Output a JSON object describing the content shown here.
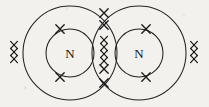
{
  "figure": {
    "background_color": "#f2f1ee",
    "ink_color": "#1a1a1a",
    "width": 209,
    "height": 107
  },
  "atoms": [
    {
      "id": "left-atom",
      "label": "N",
      "nucleus_cx": 70,
      "nucleus_cy": 53,
      "nucleus_r": 24,
      "shell_cx": 70,
      "shell_cy": 53,
      "shell_r": 47
    },
    {
      "id": "right-atom",
      "label": "N",
      "nucleus_cx": 139,
      "nucleus_cy": 53,
      "nucleus_r": 24,
      "shell_cx": 139,
      "shell_cy": 53,
      "shell_r": 47
    }
  ],
  "electrons": {
    "symbol": "x",
    "groups": [
      {
        "id": "left-atom-top-electron",
        "name": "left-top",
        "count": 1,
        "positions": [
          [
            60,
            29
          ]
        ]
      },
      {
        "id": "left-atom-bottom-electron",
        "name": "left-bottom",
        "count": 1,
        "positions": [
          [
            60,
            77
          ]
        ]
      },
      {
        "id": "left-atom-outer-edge-electrons",
        "name": "left-edge",
        "count": 3,
        "positions": [
          [
            14,
            45
          ],
          [
            14,
            52
          ],
          [
            14,
            59
          ]
        ]
      },
      {
        "id": "right-atom-top-electron",
        "name": "right-top",
        "count": 1,
        "positions": [
          [
            146,
            29
          ]
        ]
      },
      {
        "id": "right-atom-bottom-electron",
        "name": "right-bottom",
        "count": 1,
        "positions": [
          [
            146,
            77
          ]
        ]
      },
      {
        "id": "right-atom-outer-edge-electrons",
        "name": "right-edge",
        "count": 3,
        "positions": [
          [
            194,
            45
          ],
          [
            194,
            52
          ],
          [
            194,
            59
          ]
        ]
      },
      {
        "id": "shared-bond-electrons",
        "name": "overlap-column",
        "count": 6,
        "positions": [
          [
            104,
            13
          ],
          [
            104,
            25
          ],
          [
            104,
            40
          ],
          [
            104,
            54
          ],
          [
            104,
            69
          ],
          [
            104,
            83
          ]
        ]
      }
    ],
    "total": 16
  }
}
